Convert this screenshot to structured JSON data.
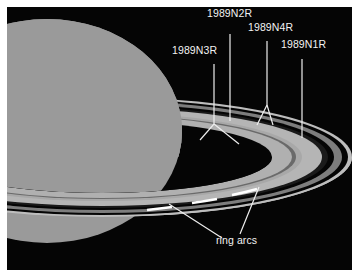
{
  "figure": {
    "colors": {
      "background": "#050505",
      "planet": "#9a9a9a",
      "ring_light": "#b8b8b8",
      "ring_mid": "#8a8a8a",
      "ring_dark": "#3a3a3a",
      "labels": "#f2f2f2"
    }
  },
  "labels": {
    "n3r": "1989N3R",
    "n2r": "1989N2R",
    "n4r": "1989N4R",
    "n1r": "1989N1R",
    "ring_arcs": "ring arcs"
  }
}
